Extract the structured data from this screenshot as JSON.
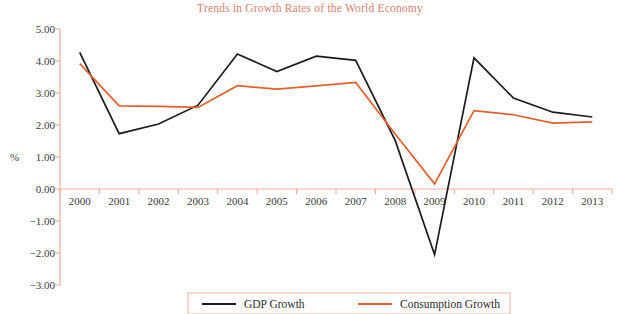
{
  "chart_data": {
    "type": "line",
    "title": "Trends in Growth Rates of the World Economy",
    "xlabel": "",
    "ylabel": "%",
    "categories": [
      "2000",
      "2001",
      "2002",
      "2003",
      "2004",
      "2005",
      "2006",
      "2007",
      "2008",
      "2009",
      "2010",
      "2011",
      "2012",
      "2013"
    ],
    "ylim": [
      -3.0,
      5.0
    ],
    "ytick_step": 1.0,
    "yticks": [
      "5.00",
      "4.00",
      "3.00",
      "2.00",
      "1.00",
      "0.00",
      "-1.00",
      "-2.00",
      "-3.00"
    ],
    "ytick_values": [
      5.0,
      4.0,
      3.0,
      2.0,
      1.0,
      0.0,
      -1.0,
      -2.0,
      -3.0
    ],
    "grid": false,
    "legend_position": "bottom",
    "series": [
      {
        "name": "GDP Growth",
        "color": "#1c1c1c",
        "values": [
          4.27,
          1.73,
          2.03,
          2.62,
          4.22,
          3.67,
          4.15,
          4.02,
          1.52,
          -2.05,
          4.1,
          2.84,
          2.4,
          2.25
        ]
      },
      {
        "name": "Consumption Growth",
        "color": "#e2602c",
        "values": [
          3.92,
          2.6,
          2.58,
          2.55,
          3.23,
          3.12,
          3.22,
          3.33,
          1.72,
          0.16,
          2.45,
          2.32,
          2.06,
          2.1
        ]
      }
    ]
  },
  "legend": {
    "items": [
      {
        "label": "GDP Growth",
        "color": "#1c1c1c"
      },
      {
        "label": "Consumption Growth",
        "color": "#e2602c"
      }
    ]
  },
  "colors": {
    "title": "#d4816b",
    "axis": "#eeab96",
    "gdp_line": "#1c1c1c",
    "consumption_line": "#e2602c",
    "legend_border": "#f0b8a6",
    "tick_text": "#3a3a3a",
    "background": "#ffffff"
  }
}
